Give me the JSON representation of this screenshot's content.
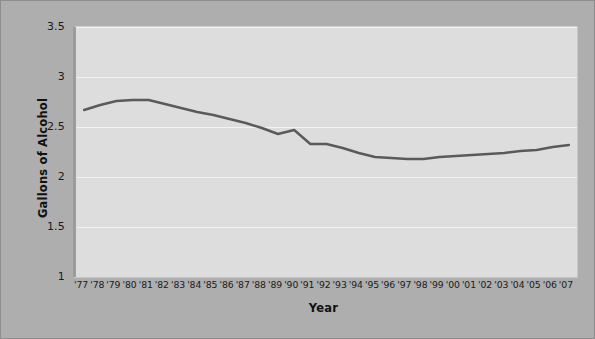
{
  "chart_data": {
    "type": "line",
    "title": "",
    "xlabel": "Year",
    "ylabel": "Gallons of Alcohol",
    "categories": [
      "'77",
      "'78",
      "'79",
      "'80",
      "'81",
      "'82",
      "'83",
      "'84",
      "'85",
      "'86",
      "'87",
      "'88",
      "'89",
      "'90",
      "'91",
      "'92",
      "'93",
      "'94",
      "'95",
      "'96",
      "'97",
      "'98",
      "'99",
      "'00",
      "'01",
      "'02",
      "'03",
      "'04",
      "'05",
      "'06",
      "'07"
    ],
    "values": [
      2.67,
      2.72,
      2.76,
      2.77,
      2.77,
      2.73,
      2.69,
      2.65,
      2.62,
      2.58,
      2.54,
      2.49,
      2.43,
      2.47,
      2.33,
      2.33,
      2.29,
      2.24,
      2.2,
      2.19,
      2.18,
      2.18,
      2.2,
      2.21,
      2.22,
      2.23,
      2.24,
      2.26,
      2.27,
      2.3,
      2.32
    ],
    "series": [
      {
        "name": "Gallons of Alcohol",
        "values": [
          2.67,
          2.72,
          2.76,
          2.77,
          2.77,
          2.73,
          2.69,
          2.65,
          2.62,
          2.58,
          2.54,
          2.49,
          2.43,
          2.47,
          2.33,
          2.33,
          2.29,
          2.24,
          2.2,
          2.19,
          2.18,
          2.18,
          2.2,
          2.21,
          2.22,
          2.23,
          2.24,
          2.26,
          2.27,
          2.3,
          2.32
        ],
        "color": "#5a5a5a"
      }
    ],
    "ylim": [
      1,
      3.5
    ],
    "yticks": [
      "3.5",
      "3",
      "2.5",
      "2",
      "1.5",
      "1"
    ],
    "ytick_values": [
      3.5,
      3,
      2.5,
      2,
      1.5,
      1
    ],
    "grid": true,
    "grid_color": "#f2f2f2",
    "legend": "none",
    "plot_background": "#dddddd",
    "figure_background": "#aeaeae",
    "line_color": "#5a5a5a",
    "line_width": 2.4
  }
}
